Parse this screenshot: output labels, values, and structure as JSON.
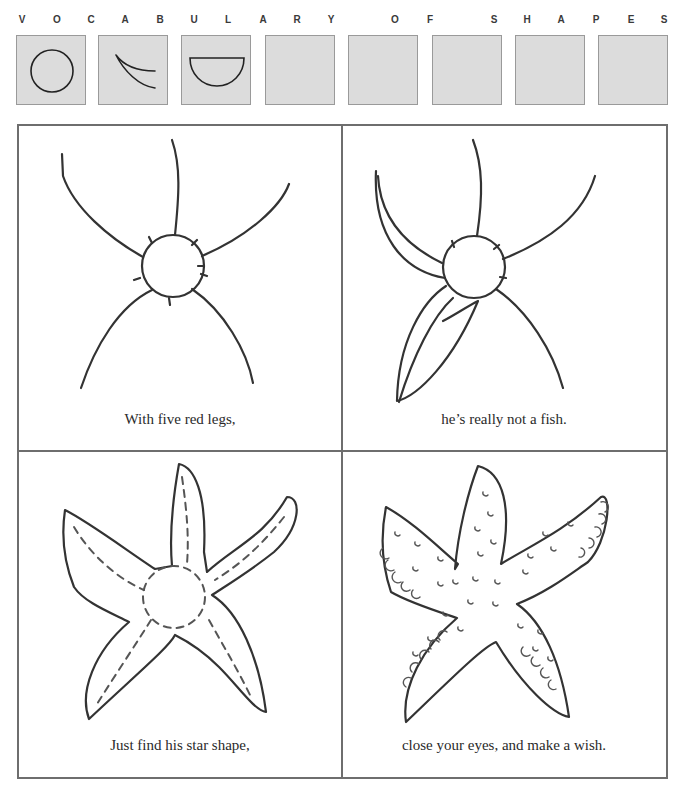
{
  "header": {
    "letters": [
      {
        "char": "V",
        "x": 22
      },
      {
        "char": "O",
        "x": 57
      },
      {
        "char": "C",
        "x": 91
      },
      {
        "char": "A",
        "x": 125
      },
      {
        "char": "B",
        "x": 160
      },
      {
        "char": "U",
        "x": 194
      },
      {
        "char": "L",
        "x": 228
      },
      {
        "char": "A",
        "x": 263
      },
      {
        "char": "R",
        "x": 297
      },
      {
        "char": "Y",
        "x": 331
      },
      {
        "char": "O",
        "x": 395
      },
      {
        "char": "F",
        "x": 430
      },
      {
        "char": "S",
        "x": 494
      },
      {
        "char": "H",
        "x": 527
      },
      {
        "char": "A",
        "x": 561
      },
      {
        "char": "P",
        "x": 596
      },
      {
        "char": "E",
        "x": 631
      },
      {
        "char": "S",
        "x": 664
      }
    ]
  },
  "vocabulary_boxes": [
    {
      "shape": "circle",
      "x": 16
    },
    {
      "shape": "crescent-arc",
      "x": 98
    },
    {
      "shape": "half-circle",
      "x": 181
    },
    {
      "shape": "empty",
      "x": 265
    },
    {
      "shape": "empty",
      "x": 348
    },
    {
      "shape": "empty",
      "x": 432
    },
    {
      "shape": "empty",
      "x": 515
    },
    {
      "shape": "empty",
      "x": 598
    }
  ],
  "panels": [
    {
      "step": 1,
      "caption": "With five red legs,",
      "drawing": "circle-body-with-five-leg-lines"
    },
    {
      "step": 2,
      "caption": "he’s really not a fish.",
      "drawing": "legs-being-thickened"
    },
    {
      "step": 3,
      "caption": "Just find his star shape,",
      "drawing": "star-outline-with-dashed-guides"
    },
    {
      "step": 4,
      "caption": "close your eyes, and make a wish.",
      "drawing": "finished-starfish-with-dots"
    }
  ],
  "colors": {
    "box_fill": "#dcdcdc",
    "box_border": "#9a9a9a",
    "grid_border": "#6e6e6e",
    "ink": "#333333"
  }
}
